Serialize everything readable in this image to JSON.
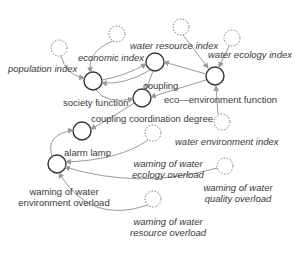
{
  "diagram": {
    "type": "system dynamics causal diagram",
    "colors": {
      "node_stroke": "#333333",
      "cloud_stroke": "#777777",
      "arrow": "#9a9a9a",
      "text": "#3a3a3a"
    },
    "labels": {
      "population_index": "population index",
      "economic_index": "economic index",
      "water_resource_index": "water resource index",
      "water_ecology_index": "water ecology index",
      "coupling": "coupling",
      "society_function": "society function",
      "eco_environment_function": "eco—environment function",
      "coupling_coordination_degree": "coupling coordination degree",
      "water_environment_index": "water environment index",
      "alarm_lamp": "alarm lamp",
      "warning_water_env_line1": "waming of water",
      "warning_water_env_line2": "environment overload",
      "warning_ecology_line1": "waming of water",
      "warning_ecology_line2": "ecology overload",
      "warning_quality_line1": "waming of water",
      "warning_quality_line2": "quality overload",
      "warning_resource_line1": "waming of water",
      "warning_resource_line2": "resource overload"
    }
  }
}
